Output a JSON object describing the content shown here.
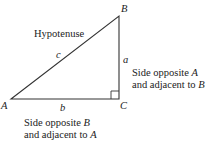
{
  "diagram": {
    "type": "right-triangle",
    "vertices": {
      "A": {
        "label": "A",
        "x": 11,
        "y": 99
      },
      "B": {
        "label": "B",
        "x": 119,
        "y": 16
      },
      "C": {
        "label": "C",
        "x": 119,
        "y": 99
      }
    },
    "sides": {
      "c": {
        "label": "c",
        "name": "Hypotenuse"
      },
      "a": {
        "label": "a",
        "desc_line1": "Side opposite ",
        "desc_line1_var": "A",
        "desc_line2": "and adjacent to ",
        "desc_line2_var": "B"
      },
      "b": {
        "label": "b",
        "desc_line1": "Side opposite ",
        "desc_line1_var": "B",
        "desc_line2": "and adjacent to ",
        "desc_line2_var": "A"
      }
    },
    "right_angle_at": "C",
    "stroke_color": "#333333"
  }
}
